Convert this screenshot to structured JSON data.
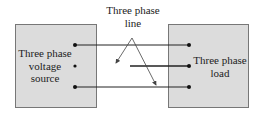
{
  "diagram": {
    "source": {
      "label_lines": [
        "Three phase",
        "voltage",
        "source"
      ]
    },
    "load": {
      "label_lines": [
        "Three phase",
        "load"
      ]
    },
    "line": {
      "label_lines": [
        "Three phase",
        "line"
      ]
    },
    "conductors": 3,
    "colors": {
      "box_fill": "#dcdcdc",
      "box_border": "#777777",
      "wire": "#222222"
    }
  }
}
